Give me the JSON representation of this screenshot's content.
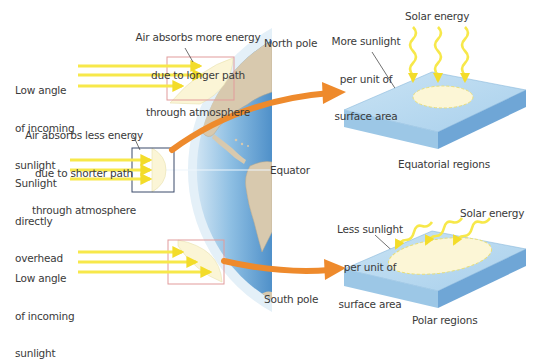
{
  "diagram": {
    "title": "",
    "labels": {
      "north_pole": "North pole",
      "south_pole": "South pole",
      "equator": "Equator",
      "low_angle_top": [
        "Low angle",
        "of incoming",
        "sunlight"
      ],
      "low_angle_bottom": [
        "Low angle",
        "of incoming",
        "sunlight"
      ],
      "direct": [
        "Sunlight",
        "directly",
        "overhead"
      ],
      "air_more": [
        "Air absorbs more energy",
        "due to longer path",
        "through atmosphere"
      ],
      "air_less": [
        "Air absorbs less energy",
        "due to shorter path",
        "through atmosphere"
      ],
      "more_sunlight": [
        "More sunlight",
        "per unit of",
        "surface area"
      ],
      "less_sunlight": [
        "Less sunlight",
        "per unit of",
        "surface area"
      ],
      "solar_energy_top": "Solar energy",
      "solar_energy_bottom": "Solar energy",
      "equatorial_regions": "Equatorial regions",
      "polar_regions": "Polar regions"
    },
    "colors": {
      "sunlight": "#f7e84a",
      "ocean": "#5f9fd3",
      "ocean_light": "#b9d8ee",
      "atmosphere": "#dcecf7",
      "land": "#d9cbb2",
      "orange_arrow": "#ee8a2c",
      "highlight_box_red": "#e59a9a",
      "highlight_box_dark": "#3b4a6b",
      "slab_top": "#bcdcf0",
      "slab_side": "#7fb2dc",
      "patch": "#fcf6d6"
    }
  }
}
